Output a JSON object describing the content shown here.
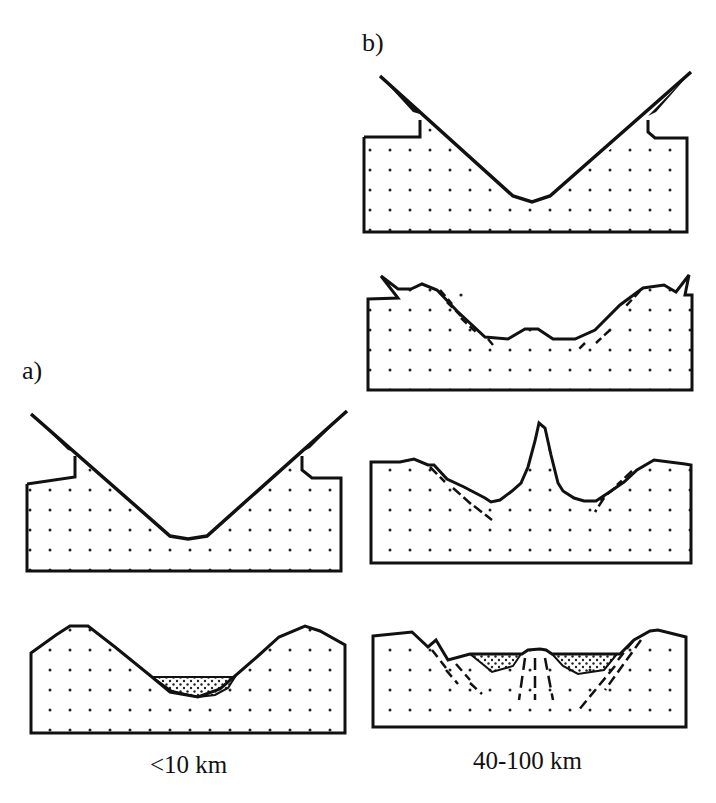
{
  "labels": {
    "panel_a": "a)",
    "panel_b": "b)"
  },
  "captions": {
    "a": "<10 km",
    "b": "40-100 km"
  },
  "colors": {
    "stroke": "#111111",
    "background": "#ffffff",
    "dot": "#222222"
  },
  "panels": {
    "a": {
      "stages": [
        "initial V-shaped rift with shoulders",
        "eroded valley with sediment fill"
      ]
    },
    "b": {
      "stages": [
        "initial V-shaped rift with shoulders",
        "faulted valley with small central high",
        "valley with central peak and faults",
        "basin with sediment fill and dashed faults"
      ]
    }
  }
}
